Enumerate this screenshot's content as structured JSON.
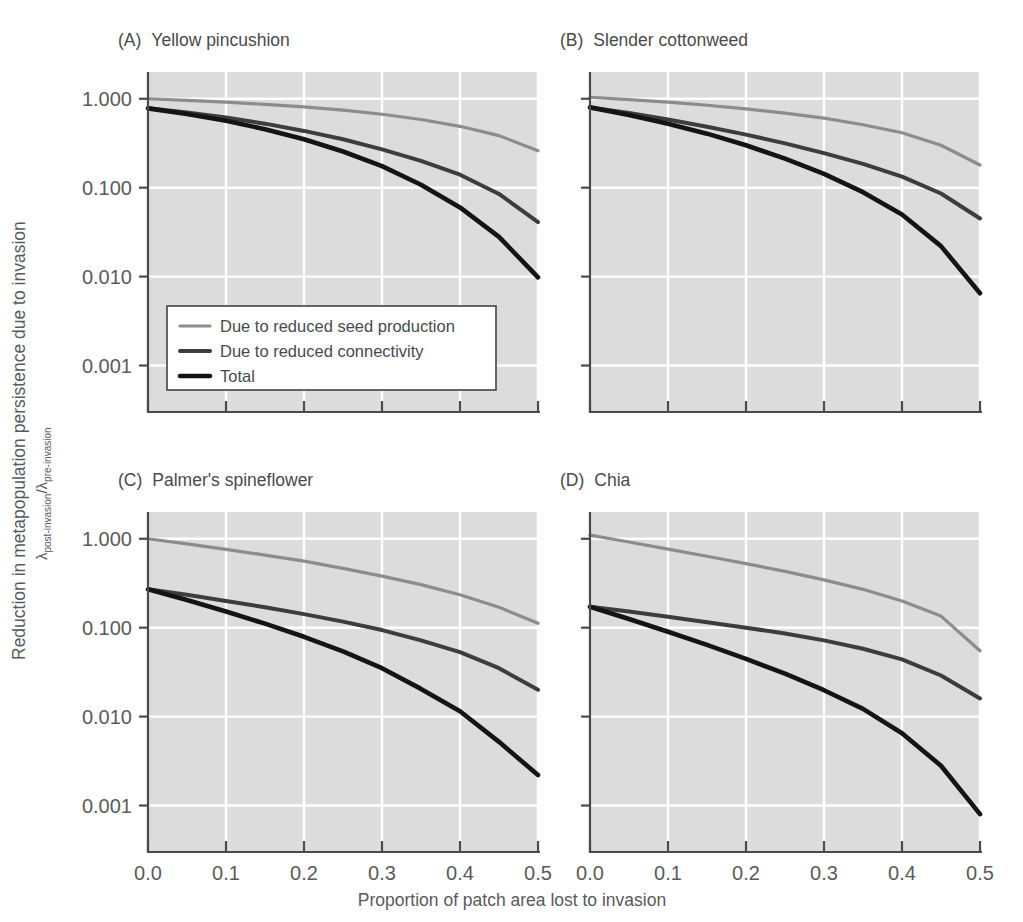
{
  "figure": {
    "xlabel": "Proportion of patch area lost to invasion",
    "ylabel_line1": "Reduction in metapopulation persistence due to invasion",
    "ylabel_lambda": "λ",
    "ylabel_sub_post": "post-invasion",
    "ylabel_slash": "/",
    "ylabel_sub_pre": "pre-invasion",
    "plot_bg_color": "#dcdcdc",
    "grid_color": "#ffffff",
    "axis_color": "#4a4a4a"
  },
  "legend": {
    "items": [
      {
        "label": "Due to reduced seed production",
        "color": "#8c8c8c",
        "width": 3.2
      },
      {
        "label": "Due to reduced connectivity",
        "color": "#3d3d3d",
        "width": 4.0
      },
      {
        "label": "Total",
        "color": "#141414",
        "width": 4.6
      }
    ]
  },
  "chart_data": {
    "type": "line",
    "xlabel": "Proportion of patch area lost to invasion",
    "ylabel": "Reduction in metapopulation persistence due to invasion (λ post-invasion / λ pre-invasion)",
    "xlim": [
      0.0,
      0.5
    ],
    "ylim": [
      0.0003,
      2.0
    ],
    "yscale": "log",
    "xticks": [
      "0.0",
      "0.1",
      "0.2",
      "0.3",
      "0.4",
      "0.5"
    ],
    "xtick_values": [
      0.0,
      0.1,
      0.2,
      0.3,
      0.4,
      0.5
    ],
    "yticks": [
      "1.000",
      "0.100",
      "0.010",
      "0.001"
    ],
    "ytick_values": [
      1.0,
      0.1,
      0.01,
      0.001
    ],
    "grid": true,
    "legend_position": "lower-left of panel A",
    "panels": [
      {
        "key": "A",
        "tag": "(A)",
        "title": "Yellow pincushion",
        "x": [
          0.0,
          0.05,
          0.1,
          0.15,
          0.2,
          0.25,
          0.3,
          0.35,
          0.4,
          0.45,
          0.5
        ],
        "series": [
          {
            "name": "Due to reduced seed production",
            "color": "#8c8c8c",
            "width": 3.2,
            "values": [
              1.0,
              0.96,
              0.915,
              0.865,
              0.81,
              0.745,
              0.67,
              0.585,
              0.49,
              0.385,
              0.26
            ]
          },
          {
            "name": "Due to reduced connectivity",
            "color": "#3d3d3d",
            "width": 4.0,
            "values": [
              0.78,
              0.7,
              0.615,
              0.525,
              0.435,
              0.35,
              0.27,
              0.2,
              0.14,
              0.085,
              0.041
            ]
          },
          {
            "name": "Total",
            "color": "#141414",
            "width": 4.6,
            "values": [
              0.78,
              0.675,
              0.565,
              0.455,
              0.35,
              0.255,
              0.175,
              0.108,
              0.06,
              0.028,
              0.0098
            ]
          }
        ]
      },
      {
        "key": "B",
        "tag": "(B)",
        "title": "Slender cottonweed",
        "x": [
          0.0,
          0.05,
          0.1,
          0.15,
          0.2,
          0.25,
          0.3,
          0.35,
          0.4,
          0.45,
          0.5
        ],
        "series": [
          {
            "name": "Due to reduced seed production",
            "color": "#8c8c8c",
            "width": 3.2,
            "values": [
              1.04,
              0.98,
              0.915,
              0.845,
              0.77,
              0.69,
              0.605,
              0.51,
              0.415,
              0.3,
              0.18
            ]
          },
          {
            "name": "Due to reduced connectivity",
            "color": "#3d3d3d",
            "width": 4.0,
            "values": [
              0.8,
              0.69,
              0.585,
              0.485,
              0.395,
              0.315,
              0.245,
              0.185,
              0.133,
              0.086,
              0.045
            ]
          },
          {
            "name": "Total",
            "color": "#141414",
            "width": 4.6,
            "values": [
              0.8,
              0.655,
              0.525,
              0.405,
              0.3,
              0.212,
              0.143,
              0.089,
              0.05,
              0.022,
              0.0065
            ]
          }
        ]
      },
      {
        "key": "C",
        "tag": "(C)",
        "title": "Palmer's spineflower",
        "x": [
          0.0,
          0.05,
          0.1,
          0.15,
          0.2,
          0.25,
          0.3,
          0.35,
          0.4,
          0.45,
          0.5
        ],
        "series": [
          {
            "name": "Due to reduced seed production",
            "color": "#8c8c8c",
            "width": 3.2,
            "values": [
              1.0,
              0.875,
              0.76,
              0.655,
              0.56,
              0.465,
              0.38,
              0.305,
              0.235,
              0.17,
              0.112
            ]
          },
          {
            "name": "Due to reduced connectivity",
            "color": "#3d3d3d",
            "width": 4.0,
            "values": [
              0.27,
              0.235,
              0.2,
              0.17,
              0.142,
              0.117,
              0.094,
              0.072,
              0.053,
              0.035,
              0.02
            ]
          },
          {
            "name": "Total",
            "color": "#141414",
            "width": 4.6,
            "values": [
              0.27,
              0.205,
              0.152,
              0.111,
              0.079,
              0.054,
              0.035,
              0.0205,
              0.0115,
              0.0052,
              0.0022
            ]
          }
        ]
      },
      {
        "key": "D",
        "tag": "(D)",
        "title": "Chia",
        "x": [
          0.0,
          0.05,
          0.1,
          0.15,
          0.2,
          0.25,
          0.3,
          0.35,
          0.4,
          0.45,
          0.5
        ],
        "series": [
          {
            "name": "Due to reduced seed production",
            "color": "#8c8c8c",
            "width": 3.2,
            "values": [
              1.1,
              0.92,
              0.765,
              0.635,
              0.525,
              0.43,
              0.345,
              0.27,
              0.2,
              0.135,
              0.055
            ]
          },
          {
            "name": "Due to reduced connectivity",
            "color": "#3d3d3d",
            "width": 4.0,
            "values": [
              0.172,
              0.152,
              0.133,
              0.115,
              0.1,
              0.086,
              0.072,
              0.058,
              0.044,
              0.029,
              0.016
            ]
          },
          {
            "name": "Total",
            "color": "#141414",
            "width": 4.6,
            "values": [
              0.172,
              0.125,
              0.09,
              0.064,
              0.0445,
              0.0305,
              0.0198,
              0.0122,
              0.0065,
              0.0028,
              0.0008
            ]
          }
        ]
      }
    ]
  }
}
